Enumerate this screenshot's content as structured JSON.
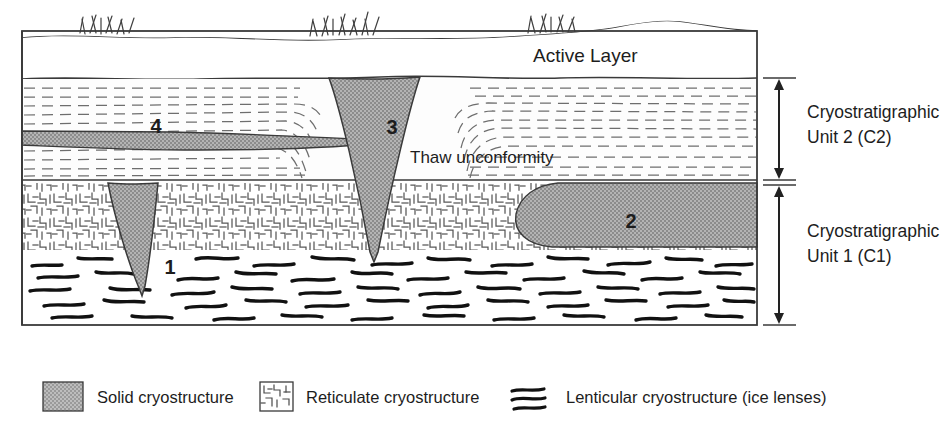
{
  "figure": {
    "type": "cross-section-diagram"
  },
  "colors": {
    "solid_cryostructure_fill": "#a2a2a2",
    "outline": "#333333",
    "dash_line": "#6e6e6e",
    "ice_lens": "#111111",
    "background": "#ffffff",
    "text": "#1d1d1d"
  },
  "diagram": {
    "surface": {
      "label": "Active Layer",
      "grass_tufts": 3
    },
    "layers": [
      {
        "id": "active-layer",
        "name": "Active Layer"
      },
      {
        "id": "unit-2",
        "name": "Cryostratigraphic Unit 2 (C2)",
        "pattern": "microlenticular"
      },
      {
        "id": "unit-1",
        "name": "Cryostratigraphic Unit 1 (C1)",
        "pattern": "reticulate-and-lenticular"
      }
    ],
    "annotations": {
      "thaw_unconformity": "Thaw unconformity"
    },
    "markers": [
      {
        "id": "marker-1",
        "label": "1",
        "x": 156,
        "y": 267,
        "describes": "narrow relict ice wedge in Unit 1"
      },
      {
        "id": "marker-2",
        "label": "2",
        "x": 631,
        "y": 222,
        "describes": "solid cryostructure body in Unit 1"
      },
      {
        "id": "marker-3",
        "label": "3",
        "x": 390,
        "y": 127,
        "describes": "active ice wedge crossing both units"
      },
      {
        "id": "marker-4",
        "label": "4",
        "x": 156,
        "y": 126,
        "describes": "ice lens body in Unit 2"
      }
    ],
    "brackets": [
      {
        "id": "bracket-unit-2",
        "line1": "Cryostratigraphic",
        "line2": "Unit 2 (C2)"
      },
      {
        "id": "bracket-unit-1",
        "line1": "Cryostratigraphic",
        "line2": "Unit 1 (C1)"
      }
    ]
  },
  "legend": {
    "items": [
      {
        "id": "legend-solid",
        "swatch": "solid-fill-swatch",
        "label": "Solid cryostructure"
      },
      {
        "id": "legend-reticulate",
        "swatch": "reticulate-swatch",
        "label": "Reticulate cryostructure"
      },
      {
        "id": "legend-lenticular",
        "swatch": "lenticular-swatch",
        "label": "Lenticular cryostructure (ice lenses)"
      }
    ]
  }
}
